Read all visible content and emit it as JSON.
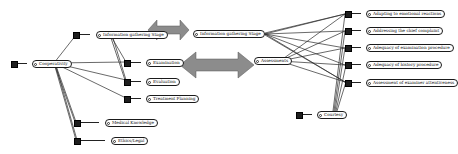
{
  "diagram": {
    "root": {
      "id": "1",
      "label": "Cooperativity"
    },
    "left_children": [
      {
        "id": "2",
        "label": "Information gathering Stage"
      },
      {
        "id": "3",
        "label": "Examination"
      },
      {
        "id": "4",
        "label": "Evaluation"
      },
      {
        "id": "5",
        "label": "Treatment Planning"
      },
      {
        "id": "6",
        "label": "Medical Knowledge"
      },
      {
        "id": "7",
        "label": "Ethics/Legal"
      }
    ],
    "center_nodes": [
      {
        "id": "8",
        "label": "Information gathering Stage"
      },
      {
        "id": "9",
        "label": "Assessments"
      }
    ],
    "right_children": [
      {
        "id": "10",
        "label": "Adapting to emotional reactions"
      },
      {
        "id": "11",
        "label": "Addressing the chief complaint"
      },
      {
        "id": "12",
        "label": "Adequacy of examination procedure"
      },
      {
        "id": "13",
        "label": "Adequacy of history procedure"
      },
      {
        "id": "14",
        "label": "Assessment of examiner attentiveness"
      },
      {
        "id": "15",
        "label": "Courtesy"
      }
    ],
    "arrows": [
      {
        "name": "double-arrow-top",
        "direction": "bidirectional"
      },
      {
        "name": "double-arrow-middle",
        "direction": "bidirectional"
      }
    ],
    "colors": {
      "arrow_fill": "#8c8c8c",
      "node_square": "#1e1e1e",
      "line": "#222222"
    }
  }
}
